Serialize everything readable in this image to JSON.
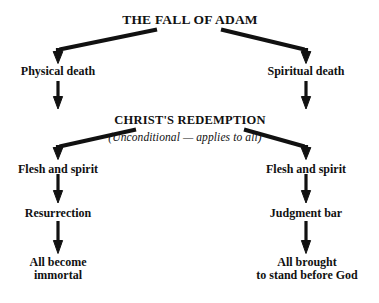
{
  "diagram": {
    "title": "THE FALL OF ADAM",
    "background_color": "#ffffff",
    "ink_color": "#111111",
    "nodes": {
      "fall_of_adam": "THE FALL OF ADAM",
      "physical_death": "Physical death",
      "spiritual_death": "Spiritual death",
      "christs_redemption": "CHRIST'S REDEMPTION",
      "redemption_note": "(Unconditional — applies to all)",
      "flesh_and_spirit_left": "Flesh and spirit",
      "flesh_and_spirit_right": "Flesh and spirit",
      "resurrection": "Resurrection",
      "judgment_bar": "Judgment bar",
      "all_become_immortal_line1": "All become",
      "all_become_immortal_line2": "immortal",
      "all_brought_line1": "All brought",
      "all_brought_line2": "to stand before God"
    }
  }
}
